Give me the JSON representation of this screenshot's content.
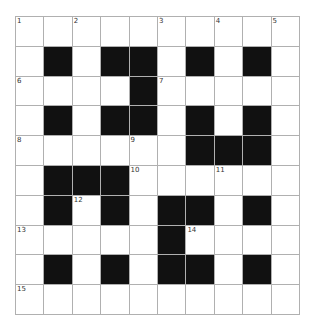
{
  "puzzle": {
    "rows": 10,
    "cols": 10,
    "grid": [
      "..........",
      ".#.##.#.#.",
      "....#.....",
      ".#.##.#.#.",
      "......###.",
      ".###......",
      ".#.#.##.#.",
      ".....#....",
      ".#.#.##.#.",
      ".........."
    ],
    "numbers": [
      {
        "row": 0,
        "col": 0,
        "n": "1"
      },
      {
        "row": 0,
        "col": 2,
        "n": "2"
      },
      {
        "row": 0,
        "col": 5,
        "n": "3"
      },
      {
        "row": 0,
        "col": 7,
        "n": "4"
      },
      {
        "row": 0,
        "col": 9,
        "n": "5"
      },
      {
        "row": 2,
        "col": 0,
        "n": "6"
      },
      {
        "row": 2,
        "col": 5,
        "n": "7"
      },
      {
        "row": 4,
        "col": 0,
        "n": "8"
      },
      {
        "row": 4,
        "col": 4,
        "n": "9"
      },
      {
        "row": 5,
        "col": 4,
        "n": "10"
      },
      {
        "row": 5,
        "col": 7,
        "n": "11"
      },
      {
        "row": 6,
        "col": 2,
        "n": "12"
      },
      {
        "row": 7,
        "col": 0,
        "n": "13"
      },
      {
        "row": 7,
        "col": 6,
        "n": "14"
      },
      {
        "row": 9,
        "col": 0,
        "n": "15"
      }
    ]
  }
}
